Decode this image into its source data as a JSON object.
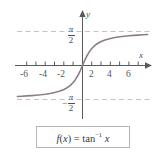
{
  "figure": {
    "name": "arctangent-function-graph",
    "background_color": "#ffffff"
  },
  "axes": {
    "x_label": "x",
    "y_label": "y",
    "axis_color": "#5a5a5a",
    "x_tick_labels": [
      "-6",
      "-4",
      "-2",
      "2",
      "4",
      "6"
    ],
    "x_tick_values": [
      -6,
      -4,
      -2,
      2,
      4,
      6
    ],
    "y_asymptote_upper_label": {
      "minus": "",
      "numerator": "π",
      "denominator": "2"
    },
    "y_asymptote_lower_label": {
      "minus": "−",
      "numerator": "π",
      "denominator": "2"
    }
  },
  "formula": {
    "prefix": "f",
    "open": "(",
    "variable": "x",
    "close": ")",
    "equals": "=",
    "func": "tan",
    "exponent": "−1",
    "argument": "x",
    "full_text": "f(x) = tan−1 x",
    "border_color": "#b5b5b5"
  },
  "chart_data": {
    "type": "line",
    "title": "",
    "xlabel": "x",
    "ylabel": "y",
    "function": "f(x) = tan^-1 x",
    "xlim": [
      -7.2,
      7.2
    ],
    "ylim": [
      -2.05,
      2.05
    ],
    "grid": false,
    "legend": null,
    "curve_color": "#8c7f88",
    "asymptotes": [
      {
        "value": 1.5708,
        "label": "π/2",
        "style": "dashed",
        "color": "#c8bfc4"
      },
      {
        "value": -1.5708,
        "label": "-π/2",
        "style": "dashed",
        "color": "#c8bfc4"
      }
    ],
    "x": [
      -7,
      -6.5,
      -6,
      -5.5,
      -5,
      -4.5,
      -4,
      -3.5,
      -3,
      -2.5,
      -2,
      -1.75,
      -1.5,
      -1.25,
      -1,
      -0.75,
      -0.5,
      -0.25,
      0,
      0.25,
      0.5,
      0.75,
      1,
      1.25,
      1.5,
      1.75,
      2,
      2.5,
      3,
      3.5,
      4,
      4.5,
      5,
      5.5,
      6,
      6.5,
      7
    ],
    "values": [
      -1.4289,
      -1.4182,
      -1.4056,
      -1.3909,
      -1.3734,
      -1.3521,
      -1.3258,
      -1.2925,
      -1.249,
      -1.1903,
      -1.1071,
      -1.0517,
      -0.9828,
      -0.8961,
      -0.7854,
      -0.6435,
      -0.4636,
      -0.245,
      0.0,
      0.245,
      0.4636,
      0.6435,
      0.7854,
      0.8961,
      0.9828,
      1.0517,
      1.1071,
      1.1903,
      1.249,
      1.2925,
      1.3258,
      1.3521,
      1.3734,
      1.3909,
      1.4056,
      1.4182,
      1.4289
    ]
  }
}
